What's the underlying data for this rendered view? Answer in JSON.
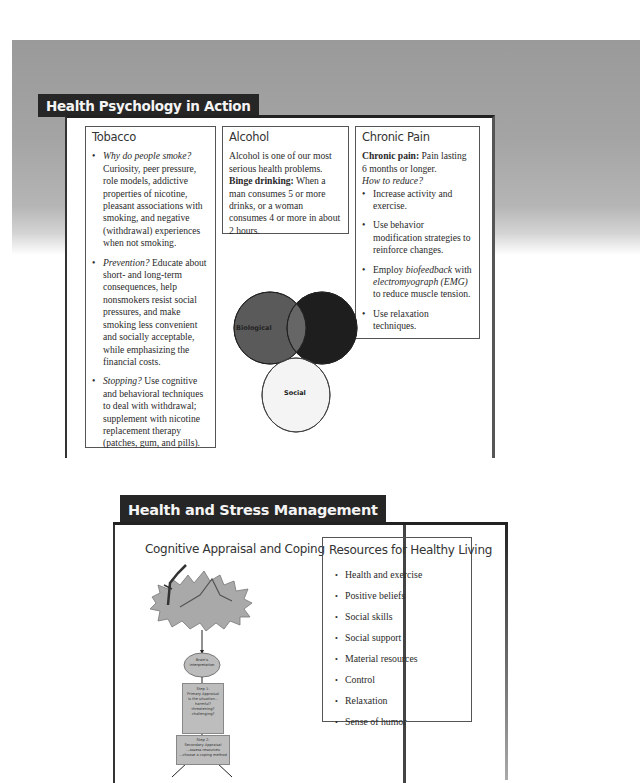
{
  "panel1": {
    "title": "Health Psychology in Action",
    "columns": {
      "tobacco": {
        "heading": "Tobacco",
        "bullets": [
          {
            "lead": "Why do people smoke?",
            "text": " Curiosity, peer pressure, role models, addictive properties of nicotine, pleasant associations with smoking, and negative (withdrawal) experiences when not smoking."
          },
          {
            "lead": "Prevention?",
            "text": " Educate about short- and long-term consequences, help nonsmokers resist social pressures, and make smoking less convenient and socially acceptable, while emphasizing the financial costs."
          },
          {
            "lead": "Stopping?",
            "text": " Use cognitive and behavioral techniques to deal with withdrawal; supplement with nicotine replacement therapy (patches, gum, and pills)."
          }
        ]
      },
      "alcohol": {
        "heading": "Alcohol",
        "intro": "Alcohol is one of our most serious health problems.",
        "term": "Binge drinking:",
        "definition": " When a man consumes 5 or more drinks, or a woman consumes 4 or more in about 2 hours."
      },
      "chronic_pain": {
        "heading": "Chronic Pain",
        "term": "Chronic pain:",
        "definition": " Pain lasting 6 months or longer.",
        "question": "How to reduce?",
        "bullets": [
          {
            "pre": "Increase activity and exercise.",
            "it": "",
            "mid": "",
            "it2": "",
            "post": ""
          },
          {
            "pre": "Use behavior modification strategies to reinforce changes.",
            "it": "",
            "mid": "",
            "it2": "",
            "post": ""
          },
          {
            "pre": "Employ ",
            "it": "biofeedback",
            "mid": " with ",
            "it2": "electromyograph (EMG)",
            "post": " to reduce muscle tension."
          },
          {
            "pre": "Use relaxation techniques.",
            "it": "",
            "mid": "",
            "it2": "",
            "post": ""
          }
        ]
      }
    },
    "venn": {
      "labels": {
        "biological": "Biological",
        "psychological": "",
        "social": "Social"
      },
      "colors": {
        "biological": "#5a5a5a",
        "psychological": "#1e1e1e",
        "social": "#f4f4f4",
        "overlap_bio_psy": "#666666",
        "overlap_bio_soc": "#9a9a9a",
        "overlap_psy_soc": "#8a8a8a"
      }
    }
  },
  "panel2": {
    "title": "Health and Stress Management",
    "left_heading": "Cognitive Appraisal and Coping",
    "flowchart": {
      "node1": "Brain's Interpretation",
      "step1": [
        "Step 1:",
        "Primary Appraisal",
        "Is the situation...",
        "harmful?",
        "threatening?",
        "challenging?"
      ],
      "step2": [
        "Step 2:",
        "Secondary Appraisal",
        "...assess resources",
        "...choose a coping method"
      ]
    },
    "resources": {
      "heading": "Resources for Healthy Living",
      "items": [
        "Health and exercise",
        "Positive beliefs",
        "Social skills",
        "Social support",
        "Material resources",
        "Control",
        "Relaxation",
        "Sense of humor"
      ]
    }
  },
  "colors": {
    "banner": "#262626",
    "band": "#a0a0a0",
    "border": "#555555"
  },
  "icons": {
    "bullet": "•"
  }
}
